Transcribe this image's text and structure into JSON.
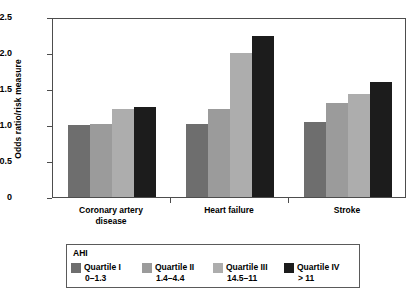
{
  "chart_data": {
    "type": "bar",
    "title": "",
    "xlabel": "",
    "ylabel": "Odds ratio/risk measure",
    "ylim": [
      0,
      2.5
    ],
    "yticks": [
      "0",
      "0.5",
      "1.0",
      "1.5",
      "2.0",
      "2.5"
    ],
    "ytick_values": [
      0,
      0.5,
      1.0,
      1.5,
      2.0,
      2.5
    ],
    "grid": false,
    "legend_position": "bottom",
    "categories": [
      "Coronary artery disease",
      "Heart failure",
      "Stroke"
    ],
    "category_lines": [
      [
        "Coronary artery",
        "disease"
      ],
      [
        "Heart failure"
      ],
      [
        "Stroke"
      ]
    ],
    "series": [
      {
        "name": "Quartile I",
        "range": "0–1.3",
        "color": "#6e6e6e",
        "values": [
          1.0,
          1.02,
          1.04
        ]
      },
      {
        "name": "Quartile II",
        "range": "1.4–4.4",
        "color": "#9b9b9b",
        "values": [
          1.01,
          1.22,
          1.3
        ]
      },
      {
        "name": "Quartile III",
        "range": "14.5–11",
        "color": "#adadad",
        "values": [
          1.22,
          2.0,
          1.43
        ]
      },
      {
        "name": "Quartile IV",
        "range": "> 11",
        "color": "#1c1c1c",
        "values": [
          1.25,
          2.24,
          1.6
        ]
      }
    ]
  },
  "legend": {
    "title": "AHI"
  }
}
